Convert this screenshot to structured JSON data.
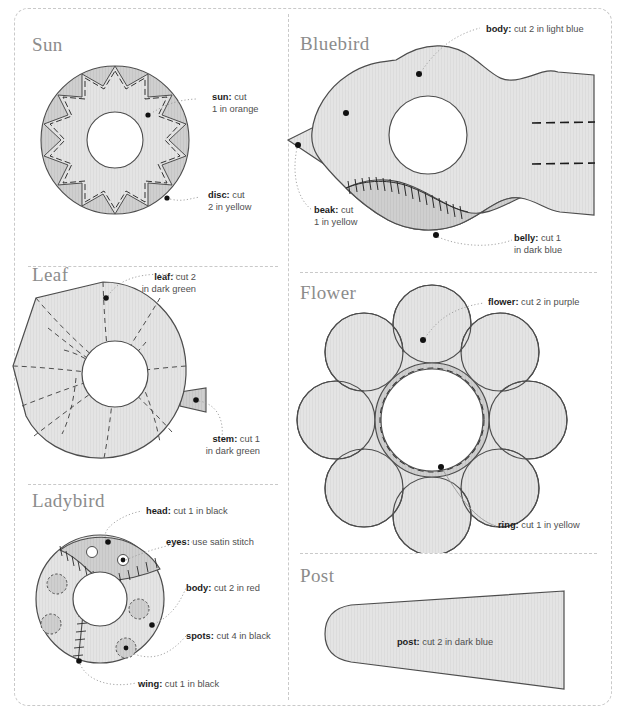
{
  "document": {
    "type": "sewing-pattern-sheet",
    "palette": {
      "shape_fill": "#e4e4e4",
      "shape_fill_dark": "#cfcfcf",
      "shape_stroke": "#4d4d4d",
      "dashed_border": "#c9c9c9",
      "heading_color": "#8c8c8c",
      "label_color": "#4f4f4f",
      "label_bold_color": "#1c1c1c",
      "marker_dot": "#111111",
      "leader_line": "#9a9a9a"
    }
  },
  "sections": [
    {
      "id": "sun",
      "heading": "Sun",
      "labels": [
        {
          "id": "sun-piece",
          "bold": "sun:",
          "rest": " cut",
          "line2": "1 in orange"
        },
        {
          "id": "disc-piece",
          "bold": "disc:",
          "rest": " cut",
          "line2": "2 in yellow"
        }
      ]
    },
    {
      "id": "bluebird",
      "heading": "Bluebird",
      "labels": [
        {
          "id": "body-piece",
          "bold": "body:",
          "rest": " cut 2 in light blue",
          "line2": ""
        },
        {
          "id": "beak-piece",
          "bold": "beak:",
          "rest": " cut",
          "line2": "1 in yellow"
        },
        {
          "id": "belly-piece",
          "bold": "belly:",
          "rest": " cut 1",
          "line2": "in dark blue"
        }
      ]
    },
    {
      "id": "leaf",
      "heading": "Leaf",
      "labels": [
        {
          "id": "leaf-piece",
          "bold": "leaf:",
          "rest": " cut 2",
          "line2": "in dark green"
        },
        {
          "id": "stem-piece",
          "bold": "stem:",
          "rest": " cut 1",
          "line2": "in dark green"
        }
      ]
    },
    {
      "id": "flower",
      "heading": "Flower",
      "labels": [
        {
          "id": "flower-piece",
          "bold": "flower:",
          "rest": " cut 2 in purple",
          "line2": ""
        },
        {
          "id": "ring-piece",
          "bold": "ring:",
          "rest": " cut 1 in yellow",
          "line2": ""
        }
      ]
    },
    {
      "id": "ladybird",
      "heading": "Ladybird",
      "labels": [
        {
          "id": "head-piece",
          "bold": "head:",
          "rest": " cut 1 in black",
          "line2": ""
        },
        {
          "id": "eyes-piece",
          "bold": "eyes:",
          "rest": " use satin stitch",
          "line2": ""
        },
        {
          "id": "body-piece",
          "bold": "body:",
          "rest": " cut 2 in red",
          "line2": ""
        },
        {
          "id": "spots-piece",
          "bold": "spots:",
          "rest": " cut 4 in black",
          "line2": ""
        },
        {
          "id": "wing-piece",
          "bold": "wing:",
          "rest": " cut 1 in black",
          "line2": ""
        }
      ]
    },
    {
      "id": "post",
      "heading": "Post",
      "labels": [
        {
          "id": "post-piece",
          "bold": "post:",
          "rest": " cut 2 in dark blue",
          "line2": ""
        }
      ]
    }
  ]
}
